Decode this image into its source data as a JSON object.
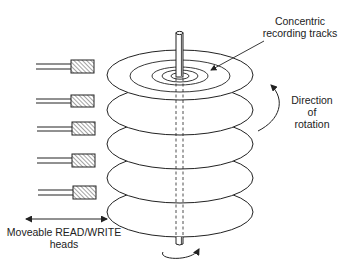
{
  "diagram": {
    "labels": {
      "tracks_line1": "Concentric",
      "tracks_line2": "recording tracks",
      "rotation_line1": "Direction",
      "rotation_line2": "of",
      "rotation_line3": "rotation",
      "heads_line1": "Moveable READ/WRITE",
      "heads_line2": "heads"
    },
    "platters": [
      {
        "cy": 75
      },
      {
        "cy": 110
      },
      {
        "cy": 144
      },
      {
        "cy": 178
      },
      {
        "cy": 212
      }
    ],
    "heads": [
      {
        "y": 60
      },
      {
        "y": 95
      },
      {
        "y": 122
      },
      {
        "y": 154
      },
      {
        "y": 186
      }
    ],
    "colors": {
      "stroke": "#222222",
      "background": "#ffffff"
    }
  }
}
